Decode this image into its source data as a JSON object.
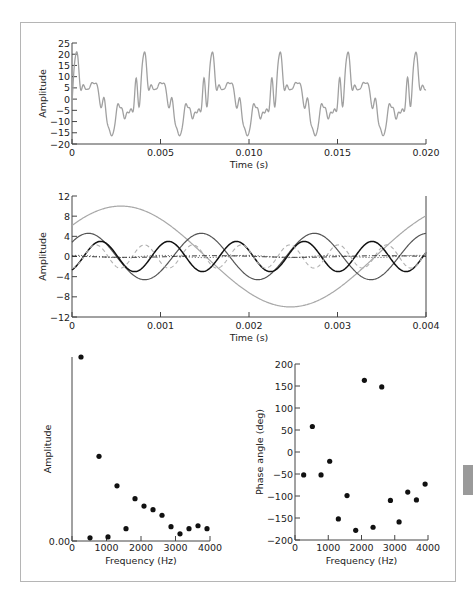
{
  "chart_data": [
    {
      "id": "waveform",
      "type": "line",
      "title": "",
      "xlabel": "Time (s)",
      "ylabel": "Amplitude",
      "xlim": [
        0,
        0.02
      ],
      "ylim": [
        -20,
        25
      ],
      "x_ticks": [
        0,
        0.005,
        0.01,
        0.015,
        0.02
      ],
      "x_tick_labels": [
        "0",
        "0.005",
        "0.010",
        "0.015",
        "0.020"
      ],
      "y_ticks": [
        25,
        20,
        15,
        10,
        5,
        0,
        -5,
        -10,
        -15,
        -20
      ],
      "y_tick_labels": [
        "25",
        "20",
        "15",
        "10",
        "5",
        "0",
        "−5",
        "−10",
        "−15",
        "−20"
      ],
      "grid": false,
      "series": [
        {
          "name": "composite signal",
          "color": "#a0a0a0",
          "style": "solid",
          "description": "Sum of harmonics of ~261 Hz fundamental (period ≈ 0.0038 s); peaks ≈ 18, troughs ≈ −15"
        }
      ]
    },
    {
      "id": "components",
      "type": "line",
      "title": "",
      "xlabel": "Time (s)",
      "ylabel": "Amplitude",
      "xlim": [
        0,
        0.004
      ],
      "ylim": [
        -12,
        12
      ],
      "x_ticks": [
        0,
        0.001,
        0.002,
        0.003,
        0.004
      ],
      "x_tick_labels": [
        "0",
        "0.001",
        "0.002",
        "0.003",
        "0.004"
      ],
      "y_ticks": [
        12,
        8,
        4,
        0,
        -4,
        -8,
        -12
      ],
      "y_tick_labels": [
        "12",
        "8",
        "4",
        "0",
        "−4",
        "−8",
        "−12"
      ],
      "grid": false,
      "series": [
        {
          "name": "261 Hz component",
          "freq": 261,
          "amp": 10.0,
          "phase_deg": -52,
          "color": "#a8a8a8",
          "style": "solid",
          "width": 1.2
        },
        {
          "name": "783 Hz component",
          "freq": 783,
          "amp": 4.6,
          "phase_deg": -52,
          "color": "#555555",
          "style": "solid",
          "width": 1.2
        },
        {
          "name": "1304 Hz component",
          "freq": 1304,
          "amp": 3.0,
          "phase_deg": -152,
          "color": "#111111",
          "style": "solid",
          "width": 1.5
        },
        {
          "name": "1826 Hz component",
          "freq": 1826,
          "amp": 2.3,
          "phase_deg": -178,
          "color": "#b0b0b0",
          "style": "dashed",
          "width": 1.1
        },
        {
          "name": "522 Hz component",
          "freq": 522,
          "amp": 0.17,
          "phase_deg": 58,
          "color": "#222222",
          "style": "dashdot",
          "width": 1.0
        },
        {
          "name": "1043 Hz component",
          "freq": 1043,
          "amp": 0.22,
          "phase_deg": -21,
          "color": "#444444",
          "style": "dotted",
          "width": 1.0
        }
      ]
    },
    {
      "id": "amplitude_spectrum",
      "type": "scatter",
      "title": "",
      "xlabel": "Frequency (Hz)",
      "ylabel": "Amplitude",
      "xlim": [
        0,
        4000
      ],
      "ylim": [
        0,
        10
      ],
      "x_ticks": [
        0,
        1000,
        2000,
        3000,
        4000
      ],
      "x_tick_labels": [
        "0",
        "1000",
        "2000",
        "3000",
        "4000"
      ],
      "y_ticks": [
        0
      ],
      "y_tick_labels": [
        "0.00"
      ],
      "grid": false,
      "x": [
        261,
        522,
        783,
        1043,
        1304,
        1565,
        1826,
        2087,
        2348,
        2609,
        2870,
        3130,
        3391,
        3652,
        3913
      ],
      "y": [
        10.0,
        0.17,
        4.6,
        0.22,
        3.0,
        0.67,
        2.3,
        1.9,
        1.7,
        1.4,
        0.78,
        0.39,
        0.67,
        0.83,
        0.67
      ]
    },
    {
      "id": "phase_spectrum",
      "type": "scatter",
      "title": "",
      "xlabel": "Frequency (Hz)",
      "ylabel": "Phase angle (deg)",
      "xlim": [
        0,
        4000
      ],
      "ylim": [
        -200,
        200
      ],
      "x_ticks": [
        0,
        1000,
        2000,
        3000,
        4000
      ],
      "x_tick_labels": [
        "0",
        "1000",
        "2000",
        "3000",
        "4000"
      ],
      "y_ticks": [
        200,
        150,
        100,
        50,
        0,
        -50,
        -100,
        -150,
        -200
      ],
      "y_tick_labels": [
        "200",
        "150",
        "100",
        "50",
        "0",
        "−50",
        "−100",
        "−150",
        "−200"
      ],
      "grid": false,
      "x": [
        261,
        522,
        783,
        1043,
        1304,
        1565,
        1826,
        2087,
        2348,
        2609,
        2870,
        3130,
        3391,
        3652,
        3913
      ],
      "y": [
        -52,
        58,
        -52,
        -21,
        -152,
        -99,
        -178,
        163,
        -171,
        148,
        -110,
        -159,
        -91,
        -109,
        -73
      ]
    }
  ],
  "colors": {
    "frame_border": "#b5b5b5",
    "axis": "#444444",
    "marker": "#111111",
    "side_tab": "#9a9a9a"
  }
}
